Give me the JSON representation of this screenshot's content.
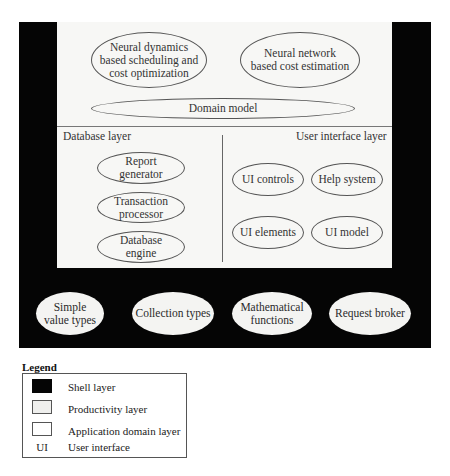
{
  "diagram": {
    "colors": {
      "shell": "#050505",
      "productivity": "#f4f4f2",
      "application": "#f7f7f5",
      "border": "#555555"
    },
    "domain_layer": {
      "components": [
        {
          "label": "Neural dynamics based scheduling and cost optimization",
          "lines": [
            "Neural dynamics",
            "based scheduling and",
            "cost optimization"
          ]
        },
        {
          "label": "Neural network based cost estimation",
          "lines": [
            "Neural network",
            "based cost estimation"
          ]
        },
        {
          "label": "Domain model",
          "lines": [
            "Domain model"
          ]
        }
      ]
    },
    "database_layer": {
      "title": "Database layer",
      "components": [
        {
          "lines": [
            "Report",
            "generator"
          ]
        },
        {
          "lines": [
            "Transaction",
            "processor"
          ]
        },
        {
          "lines": [
            "Database",
            "engine"
          ]
        }
      ]
    },
    "ui_layer": {
      "title": "User interface layer",
      "components": [
        {
          "lines": [
            "UI controls"
          ]
        },
        {
          "lines": [
            "Help system"
          ]
        },
        {
          "lines": [
            "UI elements"
          ]
        },
        {
          "lines": [
            "UI model"
          ]
        }
      ]
    },
    "shell_layer": {
      "components": [
        {
          "lines": [
            "Simple",
            "value types"
          ]
        },
        {
          "lines": [
            "Collection types"
          ]
        },
        {
          "lines": [
            "Mathematical",
            "functions"
          ]
        },
        {
          "lines": [
            "Request broker"
          ]
        }
      ]
    }
  },
  "legend": {
    "title": "Legend",
    "items": [
      {
        "swatch": "shell",
        "label": "Shell layer"
      },
      {
        "swatch": "productivity",
        "label": "Productivity layer"
      },
      {
        "swatch": "application",
        "label": "Application domain layer"
      },
      {
        "abbr": "UI",
        "label": "User interface"
      }
    ]
  }
}
